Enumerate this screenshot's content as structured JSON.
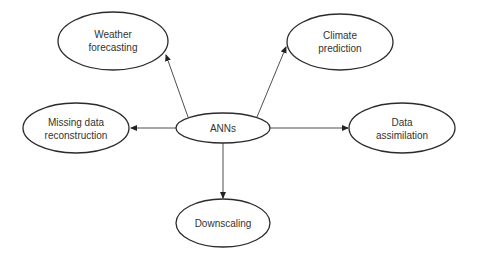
{
  "diagram": {
    "type": "hub-and-spoke",
    "center": {
      "id": "anns",
      "label": "ANNs"
    },
    "nodes": [
      {
        "id": "weather",
        "lines": [
          "Weather",
          "forecasting"
        ]
      },
      {
        "id": "climate",
        "lines": [
          "Climate",
          "prediction"
        ]
      },
      {
        "id": "missing",
        "lines": [
          "Missing data",
          "reconstruction"
        ]
      },
      {
        "id": "assimilation",
        "lines": [
          "Data",
          "assimilation"
        ]
      },
      {
        "id": "downscaling",
        "lines": [
          "Downscaling"
        ]
      }
    ],
    "edges": [
      {
        "from": "anns",
        "to": "weather"
      },
      {
        "from": "anns",
        "to": "climate"
      },
      {
        "from": "anns",
        "to": "missing"
      },
      {
        "from": "anns",
        "to": "assimilation"
      },
      {
        "from": "anns",
        "to": "downscaling"
      }
    ],
    "colors": {
      "stroke": "#2b2b2b",
      "text": "#333333",
      "background": "#ffffff"
    }
  }
}
